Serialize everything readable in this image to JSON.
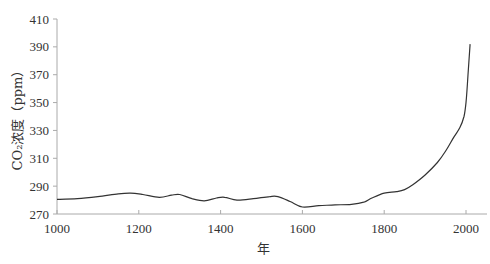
{
  "chart_data": {
    "type": "line",
    "title": "",
    "xlabel": "年",
    "ylabel": "CO₂浓度（ppm）",
    "xlim": [
      1000,
      2000
    ],
    "ylim": [
      270,
      410
    ],
    "xticks": [
      1000,
      1200,
      1400,
      1600,
      1800,
      2000
    ],
    "yticks": [
      270,
      290,
      310,
      330,
      350,
      370,
      390,
      410
    ],
    "grid": false,
    "legend": null,
    "series": [
      {
        "name": "CO2 concentration",
        "x": [
          1000,
          1050,
          1100,
          1150,
          1180,
          1210,
          1250,
          1280,
          1300,
          1330,
          1360,
          1390,
          1410,
          1440,
          1480,
          1520,
          1540,
          1570,
          1600,
          1640,
          1680,
          1720,
          1750,
          1770,
          1800,
          1830,
          1850,
          1870,
          1900,
          1930,
          1950,
          1970,
          1985,
          1995,
          2000,
          2005,
          2010
        ],
        "values": [
          280.5,
          281,
          282.5,
          284.5,
          285,
          284,
          282,
          283.5,
          284,
          281,
          279.5,
          281.5,
          282,
          280,
          281,
          282.5,
          282.5,
          279,
          275,
          276,
          276.5,
          277,
          278.5,
          281.5,
          285,
          286,
          287.5,
          291,
          298,
          307,
          315,
          325,
          332,
          340,
          350,
          370,
          392
        ]
      }
    ]
  }
}
